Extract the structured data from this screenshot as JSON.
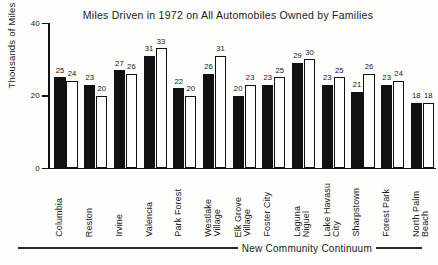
{
  "chart_data": {
    "type": "bar",
    "title": "Miles Driven in 1972 on All Automobiles Owned by Families",
    "xlabel": "New Community Continuum",
    "ylabel": "Thousands of Miles",
    "ylim": [
      0,
      40
    ],
    "yticks": [
      0,
      20,
      40
    ],
    "ytick_labels": [
      "0",
      "20",
      "40"
    ],
    "grid": false,
    "legend": "none",
    "categories": [
      "Columbia",
      "Reston",
      "Irvine",
      "Valencia",
      "Park Forest",
      "Westlake Village",
      "Elk Grove Village",
      "Foster City",
      "Laguna Niguel",
      "Lake Havasu City",
      "Sharpstown",
      "Forest Park",
      "North Palm Beach"
    ],
    "category_lines": [
      [
        "Columbia"
      ],
      [
        "Reston"
      ],
      [
        "Irvine"
      ],
      [
        "Valencia"
      ],
      [
        "Park Forest"
      ],
      [
        "Westlake",
        "Village"
      ],
      [
        "Elk Grove",
        "Village"
      ],
      [
        "Foster City"
      ],
      [
        "Laguna",
        "Niguel"
      ],
      [
        "Lake Havasu",
        "City"
      ],
      [
        "Sharpstown"
      ],
      [
        "Forest Park"
      ],
      [
        "North Palm",
        "Beach"
      ]
    ],
    "series": [
      {
        "name": "new community",
        "style": "filled",
        "color": "#111111",
        "values": [
          25,
          23,
          27,
          31,
          22,
          26,
          20,
          23,
          29,
          23,
          21,
          23,
          18
        ]
      },
      {
        "name": "paired conventional community",
        "style": "open",
        "color": "#ffffff",
        "values": [
          24,
          20,
          26,
          33,
          20,
          31,
          23,
          25,
          30,
          25,
          26,
          24,
          18
        ]
      }
    ]
  }
}
